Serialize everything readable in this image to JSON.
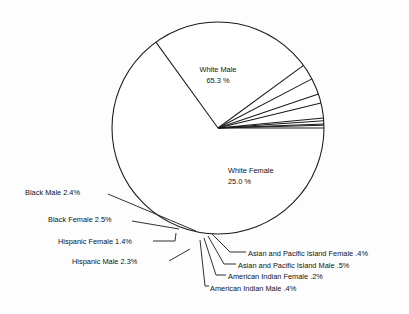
{
  "chart_data": {
    "type": "pie",
    "title": "",
    "subtitle": "",
    "xlabel": "",
    "ylabel": "",
    "legend_position": "none",
    "grid": false,
    "units": "percent",
    "total": 100.0,
    "categories": [
      "White Male",
      "White Female",
      "Black Male",
      "Black Female",
      "Hispanic Female",
      "Hispanic Male",
      "Asian and Pacific Island Female",
      "Asian and Pacific Island Male",
      "American Indian Female",
      "American Indian Male"
    ],
    "values": [
      65.3,
      25.0,
      2.4,
      2.5,
      1.4,
      2.3,
      0.4,
      0.5,
      0.2,
      0.4
    ],
    "slices": [
      {
        "label": "White Male",
        "value": 65.3,
        "value_text": "65.3 %",
        "label_placement": "inside"
      },
      {
        "label": "White Female",
        "value": 25.0,
        "value_text": "25.0 %",
        "label_placement": "inside"
      },
      {
        "label": "Black Male",
        "value": 2.4,
        "value_text": "2.4%",
        "label_placement": "callout-left"
      },
      {
        "label": "Black Female",
        "value": 2.5,
        "value_text": "2.5%",
        "label_placement": "callout-left"
      },
      {
        "label": "Hispanic Female",
        "value": 1.4,
        "value_text": "1.4%",
        "label_placement": "callout-left"
      },
      {
        "label": "Hispanic Male",
        "value": 2.3,
        "value_text": "2.3%",
        "label_placement": "callout-left"
      },
      {
        "label": "Asian and Pacific Island Female",
        "value": 0.4,
        "value_text": ".4%",
        "label_placement": "callout-right"
      },
      {
        "label": "Asian and Pacific Island Male",
        "value": 0.5,
        "value_text": ".5%",
        "label_placement": "callout-right"
      },
      {
        "label": "American Indian Female",
        "value": 0.2,
        "value_text": ".2%",
        "label_placement": "callout-right"
      },
      {
        "label": "American Indian Male",
        "value": 0.4,
        "value_text": ".4%",
        "label_placement": "callout-right"
      }
    ],
    "style": {
      "fill": "#ffffff",
      "stroke": "#1a1a1a",
      "background": "#fdfdfd"
    }
  },
  "labels": {
    "white_male_name": "White Male",
    "white_male_value": "65.3 %",
    "white_female_name": "White Female",
    "white_female_value": "25.0  %",
    "black_male": "Black Male 2.4%",
    "black_female": "Black Female 2.5%",
    "hispanic_female": "Hispanic Female 1.4%",
    "hispanic_male": "Hispanic Male 2.3%",
    "asian_female": "Asian and Pacific Island Female .4%",
    "asian_male": "Asian and Pacific Island Male .5%",
    "amerind_female": "American Indian Female .2%",
    "amerind_male": "American Indian Male .4%"
  }
}
